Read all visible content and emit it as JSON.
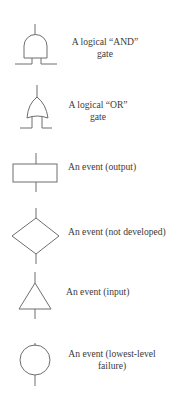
{
  "legend": {
    "items": [
      {
        "id": "and-gate",
        "symbol": "and-gate-icon",
        "lines": [
          "A logical “AND”",
          "gate"
        ]
      },
      {
        "id": "or-gate",
        "symbol": "or-gate-icon",
        "lines": [
          "A logical “OR”",
          "gate"
        ]
      },
      {
        "id": "event-output",
        "symbol": "rectangle-icon",
        "lines": [
          "An event (output)"
        ]
      },
      {
        "id": "event-not-developed",
        "symbol": "diamond-icon",
        "lines": [
          "An event (not developed)"
        ]
      },
      {
        "id": "event-input",
        "symbol": "triangle-icon",
        "lines": [
          "An event (input)"
        ]
      },
      {
        "id": "event-lowest-level-failure",
        "symbol": "circle-icon",
        "lines": [
          "An event (lowest-level",
          "failure)"
        ]
      }
    ]
  },
  "colors": {
    "stroke": "#6e6e6e",
    "text": "#3a3a3a",
    "background": "#ffffff"
  }
}
